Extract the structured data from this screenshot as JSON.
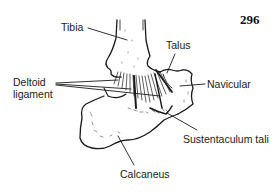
{
  "figure": {
    "page_number": "296",
    "labels": {
      "tibia": "Tibia",
      "talus": "Talus",
      "deltoid_line1": "Deltoid",
      "deltoid_line2": "ligament",
      "navicular": "Navicular",
      "sustentaculum": "Sustentaculum tali",
      "calcaneus": "Calcaneus"
    },
    "colors": {
      "ink": "#1a1a1a",
      "background": "#ffffff"
    }
  }
}
